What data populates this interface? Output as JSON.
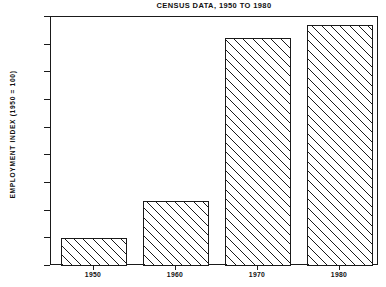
{
  "chart_data": {
    "type": "bar",
    "title": "CENSUS DATA, 1950 TO 1980",
    "xlabel": "",
    "ylabel": "EMPLOYMENT INDEX (1950 = 100)",
    "categories": [
      "1950",
      "1960",
      "1970",
      "1980"
    ],
    "values": [
      100,
      235,
      825,
      870
    ],
    "ylim": [
      0,
      900
    ],
    "yticks": [
      0,
      100,
      200,
      300,
      400,
      500,
      600,
      700,
      800,
      900
    ],
    "ytick_labels": [
      "0",
      "100",
      "200",
      "300",
      "400",
      "500",
      "600",
      "700",
      "800",
      "900"
    ],
    "xtick_labels": [
      "1950",
      "1960",
      "1970",
      "1980"
    ],
    "grid": false,
    "legend": null,
    "series": [
      {
        "name": "Employment index",
        "values": [
          100,
          235,
          825,
          870
        ]
      }
    ],
    "style": {
      "fill": "diagonal-hatch",
      "bar_color": "#ffffff",
      "line_color": "#1a1a1a",
      "background": "#ffffff"
    }
  }
}
